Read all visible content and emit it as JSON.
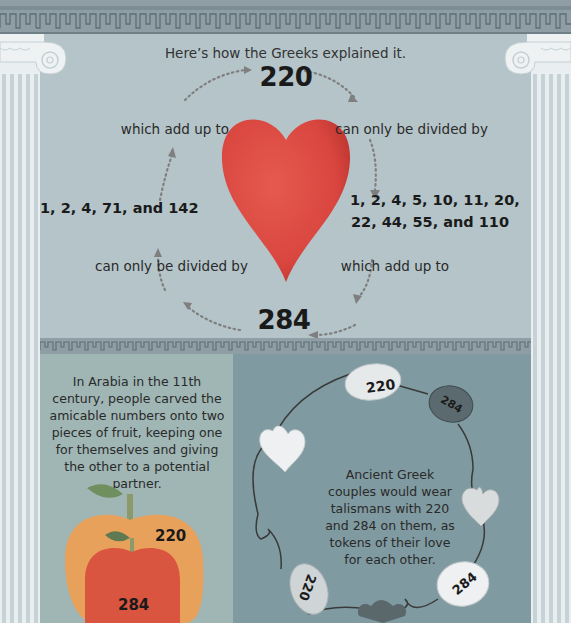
{
  "intro": "Here’s how the Greeks explained it.",
  "cycle": {
    "top_number": "220",
    "bottom_number": "284",
    "top_left_label": "which add up to",
    "top_right_label": "can only be divided by",
    "left_divisors": "1, 2, 4, 71, and 142",
    "right_divisors_line1": "1, 2, 4, 5, 10, 11, 20,",
    "right_divisors_line2": "22, 44, 55, and 110",
    "bottom_left_label": "can only be divided by",
    "bottom_right_label": "which add up to"
  },
  "arabia": {
    "text": "In Arabia in the 11th century, people carved the amicable numbers onto two pieces of fruit, keeping one for themselves and giving the other to a potential partner.",
    "apple_big_number": "220",
    "apple_small_number": "284"
  },
  "greece": {
    "text": "Ancient Greek couples would wear talismans with 220 and 284 on them, as tokens of their love for each other.",
    "talismans": [
      "220",
      "284",
      "284",
      "220"
    ]
  },
  "colors": {
    "heart": "#d9463f",
    "apple_big": "#e8a15a",
    "apple_small": "#d9553f",
    "upper_bg": "#b4c4c8",
    "lower_left_bg": "#9fb6b4",
    "lower_right_bg": "#7f9aa0"
  }
}
